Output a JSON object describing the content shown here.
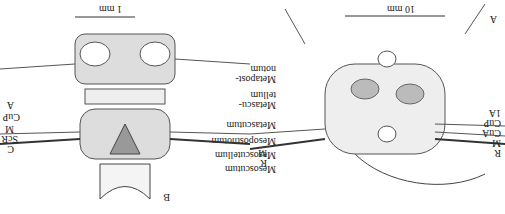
{
  "figure": {
    "orientation_rotated_deg": 180,
    "panel_A": {
      "letter": "A",
      "scale_bar": "10 mm",
      "labels_left": [
        "R",
        "M",
        "CuA",
        "CuP",
        "1A"
      ],
      "labels_right": [
        "R",
        "M"
      ]
    },
    "panel_B": {
      "letter": "B",
      "scale_bar": "1 mm",
      "labels_right": [
        "C",
        "ScR",
        "M",
        "CuP",
        "A"
      ]
    },
    "center_labels": [
      "Metapost-\nnotum",
      "Metascu-\ntellum",
      "Metascutum",
      "Mesopostnotum",
      "Mesoscutellum",
      "Mesoscutum"
    ]
  }
}
